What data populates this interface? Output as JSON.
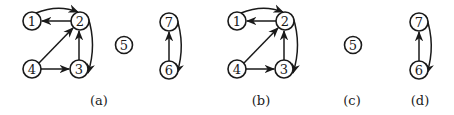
{
  "figure": {
    "panels": [
      {
        "id": "a",
        "label": "(a)"
      },
      {
        "id": "b",
        "label": "(b)"
      },
      {
        "id": "c",
        "label": "(c)"
      },
      {
        "id": "d",
        "label": "(d)"
      }
    ],
    "graph_a": {
      "nodes": [
        "1",
        "2",
        "3",
        "4",
        "5",
        "6",
        "7"
      ],
      "edges": [
        [
          "1",
          "2"
        ],
        [
          "2",
          "1"
        ],
        [
          "2",
          "3"
        ],
        [
          "3",
          "2"
        ],
        [
          "4",
          "2"
        ],
        [
          "4",
          "3"
        ],
        [
          "6",
          "7"
        ],
        [
          "7",
          "6"
        ]
      ]
    },
    "graph_b": {
      "nodes": [
        "1",
        "2",
        "3",
        "4"
      ],
      "edges": [
        [
          "1",
          "2"
        ],
        [
          "2",
          "1"
        ],
        [
          "2",
          "3"
        ],
        [
          "3",
          "2"
        ],
        [
          "4",
          "2"
        ],
        [
          "4",
          "3"
        ]
      ]
    },
    "graph_c": {
      "nodes": [
        "5"
      ],
      "edges": []
    },
    "graph_d": {
      "nodes": [
        "6",
        "7"
      ],
      "edges": [
        [
          "6",
          "7"
        ],
        [
          "7",
          "6"
        ]
      ]
    },
    "node_labels": {
      "n1": "1",
      "n2": "2",
      "n3": "3",
      "n4": "4",
      "n5": "5",
      "n6": "6",
      "n7": "7"
    }
  }
}
